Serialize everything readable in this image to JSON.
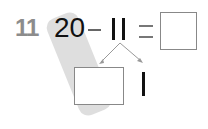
{
  "problem": {
    "number": "11",
    "minuend": "20",
    "operator": "−",
    "subtrahend": "11",
    "equals": "=",
    "answer_box": "",
    "decomposition": {
      "left_box": "",
      "right_value": "1"
    }
  }
}
